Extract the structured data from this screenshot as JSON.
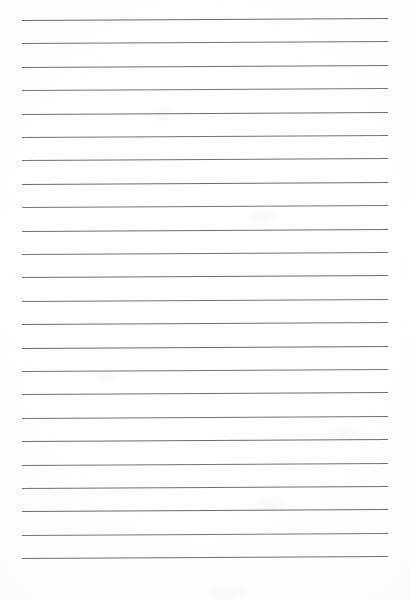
{
  "document": {
    "kind": "scanned-lined-paper",
    "title": "Blank Lined Notebook Paper",
    "orientation": "portrait",
    "page_width_px": 410,
    "page_height_px": 600,
    "text_content": "",
    "has_handwriting": false,
    "has_printed_text": false,
    "margin_rule_present": false,
    "hole_punches_present": false
  },
  "paper": {
    "background_color": "#fefefe",
    "edge_tint_color": "#f6f6f4",
    "texture": "faint scanner mottling",
    "smudges": [
      {
        "left": 248,
        "top": 212,
        "width": 30,
        "height": 10
      },
      {
        "left": 258,
        "top": 500,
        "width": 26,
        "height": 9
      },
      {
        "left": 96,
        "top": 372,
        "width": 22,
        "height": 8
      },
      {
        "left": 330,
        "top": 430,
        "width": 28,
        "height": 9
      },
      {
        "left": 150,
        "top": 110,
        "width": 24,
        "height": 8
      },
      {
        "left": 210,
        "top": 588,
        "width": 34,
        "height": 10
      }
    ]
  },
  "ruling": {
    "line_count": 24,
    "line_color": "#5e5e5e",
    "line_thickness_px": 1,
    "left_x_px": 22,
    "right_x_px": 388,
    "line_length_px": 366,
    "first_line_y_px": 20,
    "line_spacing_px": 23.4,
    "skew_degrees": -0.33,
    "top_margin_px": 20,
    "bottom_margin_px": 43,
    "left_margin_px": 22,
    "right_margin_px": 22,
    "lines": [
      {
        "index": 1,
        "y": 20.0,
        "opacity": 0.92
      },
      {
        "index": 2,
        "y": 43.4,
        "opacity": 0.88
      },
      {
        "index": 3,
        "y": 66.8,
        "opacity": 0.9
      },
      {
        "index": 4,
        "y": 90.2,
        "opacity": 0.86
      },
      {
        "index": 5,
        "y": 113.6,
        "opacity": 0.91
      },
      {
        "index": 6,
        "y": 137.0,
        "opacity": 0.87
      },
      {
        "index": 7,
        "y": 160.4,
        "opacity": 0.89
      },
      {
        "index": 8,
        "y": 183.8,
        "opacity": 0.92
      },
      {
        "index": 9,
        "y": 207.2,
        "opacity": 0.86
      },
      {
        "index": 10,
        "y": 230.6,
        "opacity": 0.9
      },
      {
        "index": 11,
        "y": 254.0,
        "opacity": 0.88
      },
      {
        "index": 12,
        "y": 277.4,
        "opacity": 0.91
      },
      {
        "index": 13,
        "y": 300.8,
        "opacity": 0.87
      },
      {
        "index": 14,
        "y": 324.2,
        "opacity": 0.89
      },
      {
        "index": 15,
        "y": 347.6,
        "opacity": 0.92
      },
      {
        "index": 16,
        "y": 371.0,
        "opacity": 0.86
      },
      {
        "index": 17,
        "y": 394.4,
        "opacity": 0.9
      },
      {
        "index": 18,
        "y": 417.8,
        "opacity": 0.88
      },
      {
        "index": 19,
        "y": 441.2,
        "opacity": 0.91
      },
      {
        "index": 20,
        "y": 464.6,
        "opacity": 0.87
      },
      {
        "index": 21,
        "y": 488.0,
        "opacity": 0.89
      },
      {
        "index": 22,
        "y": 511.4,
        "opacity": 0.92
      },
      {
        "index": 23,
        "y": 534.8,
        "opacity": 0.86
      },
      {
        "index": 24,
        "y": 558.2,
        "opacity": 0.9
      }
    ]
  }
}
